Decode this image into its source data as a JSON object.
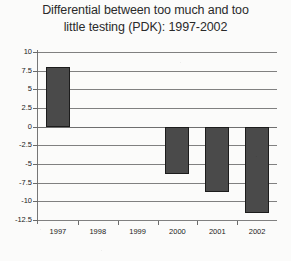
{
  "chart_data": {
    "type": "bar",
    "title": "Differential between too much and too little testing (PDK): 1997-2002",
    "title_line1": "Differential between too much and too",
    "title_line2": "little testing (PDK): 1997-2002",
    "categories": [
      "1997",
      "1998",
      "1999",
      "2000",
      "2001",
      "2002"
    ],
    "values": [
      8,
      0,
      0,
      -6.3,
      -8.8,
      -11.5
    ],
    "series": [
      {
        "name": "Differential",
        "values": [
          8,
          0,
          0,
          -6.3,
          -8.8,
          -11.5
        ]
      }
    ],
    "xlabel": "",
    "ylabel": "",
    "ylim": [
      -12.5,
      10
    ],
    "yticks": [
      10,
      7.5,
      5,
      2.5,
      0,
      -2.5,
      -5,
      -7.5,
      -10,
      -12.5
    ],
    "ytick_labels": [
      "10",
      "7.5",
      "5",
      "2.5",
      "0",
      "-2.5",
      "-5",
      "-7.5",
      "-10",
      "-12.5"
    ],
    "grid": true,
    "legend": false,
    "legend_position": "none",
    "bar_color": "#4a4a4a",
    "bar_edge_color": "#1c1c1c",
    "gridline_color": "#808080",
    "background_color": "#fbfbfa"
  }
}
